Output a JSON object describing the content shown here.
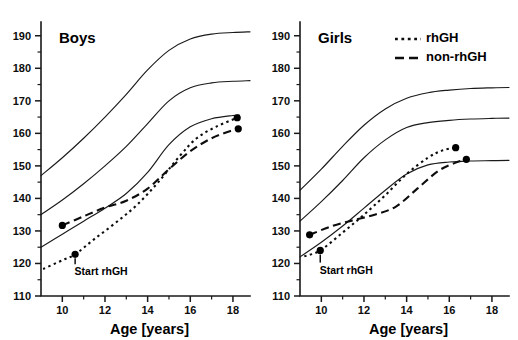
{
  "figure": {
    "background": "#ffffff",
    "line_color": "#0d0d0d",
    "width": 518,
    "height": 340
  },
  "legend": {
    "position": "top-right-of-girls-panel",
    "items": [
      {
        "label": "rhGH",
        "style": "dotted"
      },
      {
        "label": "non-rhGH",
        "style": "dashed"
      }
    ]
  },
  "chart_data": [
    {
      "type": "line",
      "title": "Boys",
      "xlabel": "Age [years]",
      "ylabel": "",
      "xlim": [
        9,
        18.8
      ],
      "ylim": [
        110,
        193
      ],
      "xticks": [
        10,
        12,
        14,
        16,
        18
      ],
      "xticks_minor": [
        9,
        11,
        13,
        15,
        17
      ],
      "yticks": [
        110,
        120,
        130,
        140,
        150,
        160,
        170,
        180,
        190
      ],
      "yticks_minor": [
        115,
        125,
        135,
        145,
        155,
        165,
        175,
        185
      ],
      "grid": false,
      "annotations": [
        {
          "text": "Start rhGH",
          "x": 10.6,
          "y": 122.8,
          "label_y": 117.0
        }
      ],
      "series": [
        {
          "name": "reference-upper",
          "style": "solid",
          "x": [
            9,
            10,
            11,
            12,
            13,
            14,
            15,
            16,
            17,
            18,
            18.8
          ],
          "y": [
            147.0,
            152.5,
            158.5,
            165.0,
            172.0,
            179.5,
            185.5,
            189.0,
            190.5,
            191.0,
            191.2
          ]
        },
        {
          "name": "reference-middle",
          "style": "solid",
          "x": [
            9,
            10,
            11,
            12,
            13,
            14,
            15,
            16,
            17,
            18,
            18.8
          ],
          "y": [
            135.0,
            139.5,
            144.5,
            150.0,
            156.0,
            163.0,
            170.0,
            174.0,
            175.5,
            176.0,
            176.2
          ]
        },
        {
          "name": "reference-lower",
          "style": "solid",
          "x": [
            9,
            10,
            11,
            12,
            13,
            14,
            15,
            16,
            17,
            18,
            18.3
          ],
          "y": [
            125.0,
            129.0,
            133.0,
            137.0,
            141.5,
            148.0,
            156.5,
            162.0,
            164.5,
            165.5,
            165.6
          ]
        },
        {
          "name": "rhGH",
          "style": "dotted",
          "x": [
            9.1,
            10.0,
            10.6,
            11.5,
            12.5,
            13.5,
            14.5,
            15.5,
            16.3,
            17.2,
            18.2
          ],
          "y": [
            118.3,
            121.0,
            122.8,
            127.5,
            132.5,
            138.0,
            145.0,
            153.0,
            158.5,
            162.0,
            164.8
          ],
          "markers": [
            {
              "x": 10.6,
              "y": 122.8
            },
            {
              "x": 18.2,
              "y": 164.8
            }
          ]
        },
        {
          "name": "non-rhGH",
          "style": "dashed",
          "x": [
            10.0,
            11.0,
            12.0,
            13.0,
            14.0,
            15.0,
            16.0,
            17.0,
            18.0,
            18.25
          ],
          "y": [
            131.7,
            134.5,
            137.2,
            139.3,
            143.0,
            149.0,
            154.5,
            158.5,
            161.0,
            161.4
          ],
          "markers": [
            {
              "x": 10.0,
              "y": 131.7
            },
            {
              "x": 18.25,
              "y": 161.4
            }
          ]
        }
      ]
    },
    {
      "type": "line",
      "title": "Girls",
      "xlabel": "Age [years]",
      "ylabel": "",
      "xlim": [
        9,
        18.8
      ],
      "ylim": [
        110,
        193
      ],
      "xticks": [
        10,
        12,
        14,
        16,
        18
      ],
      "xticks_minor": [
        9,
        11,
        13,
        15,
        17
      ],
      "yticks": [
        110,
        120,
        130,
        140,
        150,
        160,
        170,
        180,
        190
      ],
      "yticks_minor": [
        115,
        125,
        135,
        145,
        155,
        165,
        175,
        185
      ],
      "grid": false,
      "annotations": [
        {
          "text": "Start rhGH",
          "x": 9.95,
          "y": 124.0,
          "label_y": 117.5
        }
      ],
      "series": [
        {
          "name": "reference-upper",
          "style": "solid",
          "x": [
            9,
            10,
            11,
            12,
            13,
            14,
            15,
            16,
            17,
            18,
            18.8
          ],
          "y": [
            142.5,
            149.0,
            156.0,
            162.5,
            167.5,
            170.8,
            172.5,
            173.3,
            173.8,
            174.0,
            174.1
          ]
        },
        {
          "name": "reference-middle",
          "style": "solid",
          "x": [
            9,
            10,
            11,
            12,
            13,
            14,
            15,
            16,
            17,
            18,
            18.8
          ],
          "y": [
            133.0,
            139.0,
            145.5,
            152.5,
            158.0,
            161.8,
            163.3,
            164.0,
            164.4,
            164.6,
            164.7
          ]
        },
        {
          "name": "reference-lower",
          "style": "solid",
          "x": [
            9,
            10,
            11,
            12,
            13,
            14,
            15,
            16,
            17,
            18,
            18.8
          ],
          "y": [
            122.0,
            126.5,
            131.5,
            137.0,
            142.5,
            147.5,
            150.3,
            151.2,
            151.5,
            151.6,
            151.7
          ]
        },
        {
          "name": "rhGH",
          "style": "dotted",
          "x": [
            9.2,
            9.95,
            11.0,
            12.0,
            13.0,
            14.0,
            15.0,
            15.7,
            16.3
          ],
          "y": [
            122.2,
            124.0,
            129.5,
            135.0,
            141.0,
            147.5,
            152.5,
            154.8,
            155.6
          ],
          "markers": [
            {
              "x": 9.95,
              "y": 124.0
            },
            {
              "x": 16.3,
              "y": 155.6
            }
          ]
        },
        {
          "name": "non-rhGH",
          "style": "dashed",
          "x": [
            9.45,
            10.5,
            11.5,
            12.5,
            13.5,
            14.5,
            15.5,
            16.3,
            16.8
          ],
          "y": [
            128.8,
            131.5,
            133.3,
            135.0,
            137.5,
            143.0,
            148.5,
            151.0,
            152.0
          ],
          "markers": [
            {
              "x": 9.45,
              "y": 128.8
            },
            {
              "x": 16.8,
              "y": 152.0
            }
          ]
        }
      ]
    }
  ]
}
